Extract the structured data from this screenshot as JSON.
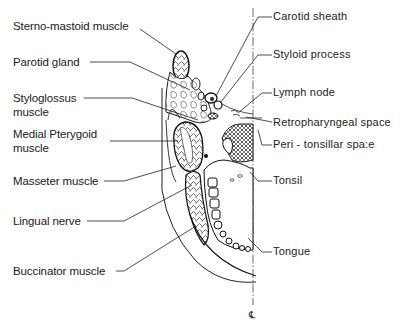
{
  "diagram": {
    "type": "anatomical-cross-section",
    "midline_symbol": "℄",
    "labels_left": [
      {
        "id": "sterno-mastoid",
        "text": "Sterno-mastoid muscle"
      },
      {
        "id": "parotid",
        "text": "Parotid gland"
      },
      {
        "id": "styloglossus-1",
        "text": "Styloglossus"
      },
      {
        "id": "styloglossus-2",
        "text": "muscle"
      },
      {
        "id": "medial-pterygoid-1",
        "text": "Medial Pterygoid"
      },
      {
        "id": "medial-pterygoid-2",
        "text": "muscle"
      },
      {
        "id": "masseter",
        "text": "Masseter muscle"
      },
      {
        "id": "lingual-nerve",
        "text": "Lingual nerve"
      },
      {
        "id": "buccinator",
        "text": "Buccinator muscle"
      }
    ],
    "labels_right": [
      {
        "id": "carotid",
        "text": "Carotid sheath"
      },
      {
        "id": "styloid",
        "text": "Styloid  process"
      },
      {
        "id": "lymph",
        "text": "Lymph  node"
      },
      {
        "id": "retropharyngeal",
        "text": "Retropharyngeal  space"
      },
      {
        "id": "peritonsillar",
        "text": "Peri - tonsillar  spa:e"
      },
      {
        "id": "tonsil",
        "text": "Tonsil"
      },
      {
        "id": "tongue",
        "text": "Tongue"
      }
    ]
  }
}
